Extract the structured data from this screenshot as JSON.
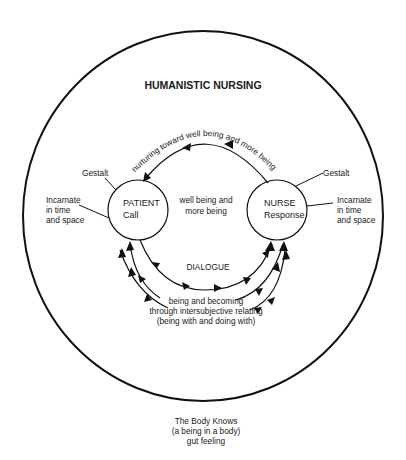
{
  "diagram": {
    "title": "HUMANISTIC NURSING",
    "outer_circle": {
      "cx": 203,
      "cy": 216,
      "rx": 180,
      "ry": 185
    },
    "patient": {
      "line1": "PATIENT",
      "line2": "Call",
      "cx": 138,
      "cy": 210,
      "r": 30
    },
    "nurse": {
      "line1": "NURSE",
      "line2": "Response",
      "cx": 277,
      "cy": 210,
      "r": 30
    },
    "center_text": {
      "line1": "well being and",
      "line2": "more being"
    },
    "top_arc_label": "nurturing toward well being and more being",
    "dialogue_label": "DIALOGUE",
    "left_side": {
      "gestalt": "Gestalt",
      "incarnate": [
        "Incarnate",
        "in time",
        "and space"
      ]
    },
    "right_side": {
      "gestalt": "Gestalt",
      "incarnate": [
        "Incarnate",
        "in time",
        "and space"
      ]
    },
    "intersubjective": [
      "being and becoming",
      "through intersubjective relating",
      "(being with and doing with)"
    ],
    "caption": [
      "The  Body Knows",
      "(a being in a body)",
      "gut feeling"
    ],
    "colors": {
      "ink": "#111111",
      "background": "#ffffff"
    }
  }
}
